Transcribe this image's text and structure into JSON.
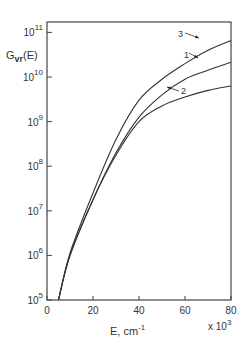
{
  "chart_data": {
    "type": "line",
    "title": "",
    "ylabel": "G_vr(E)",
    "ylabel_main": "G",
    "ylabel_sub": "vr",
    "ylabel_tail": "(E)",
    "xlabel": "E, cm",
    "xlabel_sup": "-1",
    "x_multiplier": "x 10",
    "x_multiplier_sup": "3",
    "xlim": [
      0,
      80
    ],
    "ylim": [
      100000,
      100000000000
    ],
    "yscale": "log",
    "grid": false,
    "x_ticks": [
      "0",
      "20",
      "40",
      "60",
      "80"
    ],
    "y_ticks": [
      {
        "base": "10",
        "exp": "5"
      },
      {
        "base": "10",
        "exp": "6"
      },
      {
        "base": "10",
        "exp": "7"
      },
      {
        "base": "10",
        "exp": "8"
      },
      {
        "base": "10",
        "exp": "9"
      },
      {
        "base": "10",
        "exp": "10"
      },
      {
        "base": "10",
        "exp": "11"
      }
    ],
    "x": [
      5,
      10,
      20,
      30,
      40,
      50,
      60,
      70,
      80
    ],
    "series": [
      {
        "name": "1",
        "log10_values": [
          5.0,
          6.0,
          7.25,
          8.3,
          9.1,
          9.6,
          9.95,
          10.15,
          10.33
        ]
      },
      {
        "name": "2",
        "log10_values": [
          5.0,
          6.0,
          7.25,
          8.25,
          9.0,
          9.35,
          9.55,
          9.7,
          9.8
        ]
      },
      {
        "name": "3",
        "log10_values": [
          5.0,
          6.05,
          7.4,
          8.6,
          9.48,
          9.95,
          10.3,
          10.6,
          10.82
        ]
      }
    ],
    "annotations": [
      "3",
      "1",
      "2"
    ]
  }
}
